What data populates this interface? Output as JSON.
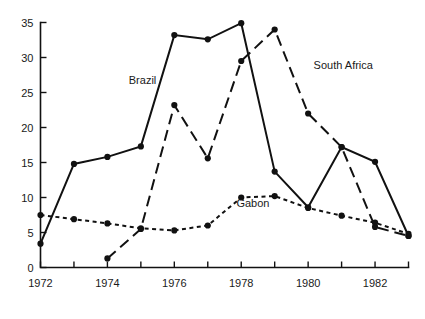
{
  "chart_data": {
    "type": "line",
    "title": "",
    "subtitle": "",
    "xlabel": "",
    "ylabel": "",
    "xlim": [
      1972,
      1983
    ],
    "ylim": [
      0,
      35
    ],
    "yticks": [
      0,
      5,
      10,
      15,
      20,
      25,
      30,
      35
    ],
    "ytick_labels": [
      "0",
      "5",
      "10",
      "15",
      "20",
      "25",
      "30",
      "35"
    ],
    "xticks": [
      1972,
      1973,
      1974,
      1975,
      1976,
      1977,
      1978,
      1979,
      1980,
      1981,
      1982,
      1983
    ],
    "xtick_labels": [
      "1972",
      "",
      "1974",
      "",
      "1976",
      "",
      "1978",
      "",
      "1980",
      "",
      "1982",
      ""
    ],
    "x": [
      1972,
      1973,
      1974,
      1975,
      1976,
      1977,
      1978,
      1979,
      1980,
      1981,
      1982,
      1983
    ],
    "grid": false,
    "legend": "inline-annotations",
    "series": [
      {
        "name": "Brazil",
        "style": "solid",
        "color": "#111111",
        "x": [
          1972,
          1973,
          1974,
          1975,
          1976,
          1977,
          1978,
          1979,
          1980,
          1981,
          1982,
          1983
        ],
        "values": [
          3.4,
          14.8,
          15.8,
          17.3,
          33.2,
          32.6,
          34.9,
          13.7,
          8.6,
          17.2,
          15.1,
          4.5
        ]
      },
      {
        "name": "South Africa",
        "style": "dashed",
        "color": "#111111",
        "x": [
          1974,
          1975,
          1976,
          1977,
          1978,
          1979,
          1980,
          1981,
          1982,
          1983
        ],
        "values": [
          1.3,
          5.5,
          23.2,
          15.6,
          29.5,
          34.0,
          22.0,
          17.2,
          5.8,
          4.5
        ]
      },
      {
        "name": "Gabon",
        "style": "dotted",
        "color": "#111111",
        "x": [
          1972,
          1973,
          1974,
          1975,
          1976,
          1977,
          1978,
          1979,
          1980,
          1981,
          1982,
          1983
        ],
        "values": [
          7.5,
          6.9,
          6.3,
          5.6,
          5.3,
          6.0,
          10.0,
          10.2,
          8.5,
          7.4,
          6.4,
          4.8
        ]
      }
    ],
    "annotations": [
      {
        "text": "Brazil",
        "x": 1975.05,
        "y": 26.2,
        "anchor": "middle"
      },
      {
        "text": "South Africa",
        "x": 1981.05,
        "y": 28.3,
        "anchor": "middle"
      },
      {
        "text": "Gabon",
        "x": 1978.35,
        "y": 8.6,
        "anchor": "middle"
      }
    ]
  }
}
